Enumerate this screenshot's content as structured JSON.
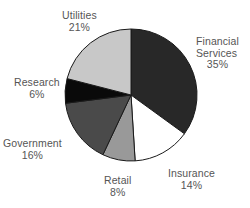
{
  "chart_data": {
    "type": "pie",
    "title": "",
    "subtitle": "",
    "xlabel": "",
    "ylabel": "",
    "legend_position": "none",
    "grid": false,
    "labels_outside": true,
    "start_angle_deg": 0,
    "direction": "clockwise",
    "center": {
      "x": 131,
      "y": 95
    },
    "radius": 66,
    "categories": [
      "Financial Services",
      "Insurance",
      "Retail",
      "Government",
      "Research",
      "Utilities"
    ],
    "values": [
      35,
      14,
      8,
      16,
      6,
      21
    ],
    "value_unit": "%",
    "slices": [
      {
        "label": "Financial Services",
        "label_line1": "Financial",
        "label_line2": "Services",
        "value": 35,
        "value_text": "35%",
        "color": "#282828",
        "start_deg": 0,
        "end_deg": 126
      },
      {
        "label": "Insurance",
        "label_line1": "Insurance",
        "label_line2": "",
        "value": 14,
        "value_text": "14%",
        "color": "#ffffff",
        "start_deg": 126,
        "end_deg": 176.4
      },
      {
        "label": "Retail",
        "label_line1": "Retail",
        "label_line2": "",
        "value": 8,
        "value_text": "8%",
        "color": "#999999",
        "start_deg": 176.4,
        "end_deg": 205.2
      },
      {
        "label": "Government",
        "label_line1": "Government",
        "label_line2": "",
        "value": 16,
        "value_text": "16%",
        "color": "#4a4a4a",
        "start_deg": 205.2,
        "end_deg": 262.8
      },
      {
        "label": "Research",
        "label_line1": "Research",
        "label_line2": "",
        "value": 6,
        "value_text": "6%",
        "color": "#0a0a0a",
        "start_deg": 262.8,
        "end_deg": 284.4
      },
      {
        "label": "Utilities",
        "label_line1": "Utilities",
        "label_line2": "",
        "value": 21,
        "value_text": "21%",
        "color": "#c8c8c8",
        "start_deg": 284.4,
        "end_deg": 360
      }
    ],
    "stroke_color": "#1a1a1a",
    "background": "#ffffff",
    "text_color": "#555555"
  }
}
